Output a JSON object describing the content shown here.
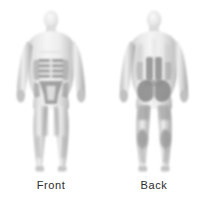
{
  "image": {
    "kind": "anatomical-body-diagram",
    "background_color": "#ffffff",
    "width": 205,
    "height": 205
  },
  "figures": [
    {
      "id": "front",
      "caption": "Front",
      "view": "anterior",
      "body_fill": "#efefef",
      "body_edge": "#8f8f8f",
      "highlight_color": "#8e8e8e",
      "shadow_color": "#b7b7b7",
      "regions": [
        {
          "name": "abdomen-rectus-bands",
          "shade": "#8e8e8e"
        },
        {
          "name": "oblique-left",
          "shade": "#9a9a9a"
        },
        {
          "name": "oblique-right",
          "shade": "#9a9a9a"
        },
        {
          "name": "inguinal-pelvic-triangle",
          "shade": "#8a8a8a"
        },
        {
          "name": "thigh-medial-shadow",
          "shade": "#b5b5b5"
        },
        {
          "name": "shin-shadow",
          "shade": "#bdbdbd"
        }
      ]
    },
    {
      "id": "back",
      "caption": "Back",
      "view": "posterior",
      "body_fill": "#efefef",
      "body_edge": "#8f8f8f",
      "highlight_color": "#8e8e8e",
      "shadow_color": "#b7b7b7",
      "regions": [
        {
          "name": "lumbar-paraspinal-left",
          "shade": "#8c8c8c"
        },
        {
          "name": "lumbar-paraspinal-right",
          "shade": "#8c8c8c"
        },
        {
          "name": "gluteal-left",
          "shade": "#868686"
        },
        {
          "name": "gluteal-right",
          "shade": "#868686"
        },
        {
          "name": "hamstring-calf-left",
          "shade": "#949494"
        },
        {
          "name": "hamstring-calf-right",
          "shade": "#949494"
        },
        {
          "name": "upper-back-shadow",
          "shade": "#c4c4c4"
        }
      ]
    }
  ]
}
